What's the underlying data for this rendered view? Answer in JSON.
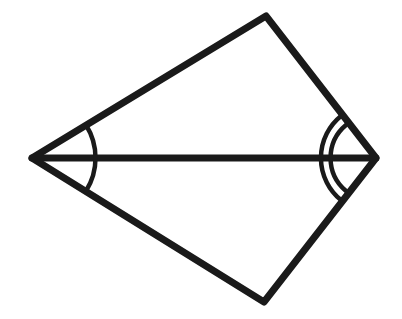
{
  "diagram": {
    "colors": {
      "stroke": "#1a1a1a",
      "background": "#ffffff"
    },
    "vertices": {
      "left": [
        32,
        158
      ],
      "top": [
        266,
        16
      ],
      "right": [
        376,
        158
      ],
      "bottom": [
        264,
        302
      ]
    },
    "segments": [
      "left-top",
      "top-right",
      "right-bottom",
      "bottom-left",
      "left-right (diagonal)"
    ],
    "angle_marks": [
      {
        "vertex": "left",
        "arcs": 1,
        "note": "single arc spanning both halves of left angle"
      },
      {
        "vertex": "right",
        "arcs": 2,
        "note": "double arc spanning both halves of right angle"
      }
    ]
  }
}
